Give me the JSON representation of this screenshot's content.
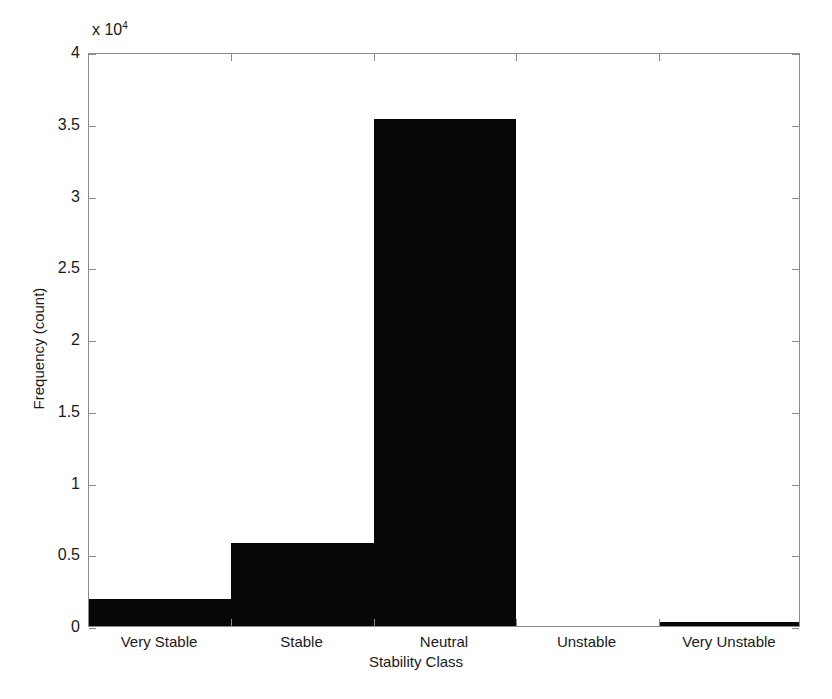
{
  "chart_data": {
    "type": "bar",
    "title": "",
    "subtitle": "",
    "xlabel": "Stability Class",
    "ylabel": "Frequency (count)",
    "categories": [
      "Very Stable",
      "Stable",
      "Neutral",
      "Unstable",
      "Very Unstable"
    ],
    "values": [
      1900,
      5800,
      35300,
      0,
      300
    ],
    "values_scaled": [
      0.19,
      0.58,
      3.53,
      0.0,
      0.03
    ],
    "y_multiplier_text": "x 10",
    "y_multiplier_exponent": "4",
    "y_multiplier_value": 10000,
    "ylim": [
      0,
      40000
    ],
    "ylim_scaled": [
      0,
      4
    ],
    "ytick_labels": [
      "0",
      "0.5",
      "1",
      "1.5",
      "2",
      "2.5",
      "3",
      "3.5",
      "4"
    ],
    "ytick_values": [
      0,
      0.5,
      1,
      1.5,
      2,
      2.5,
      3,
      3.5,
      4
    ],
    "bar_color": "#070707",
    "axis_color": "#8c8c8c",
    "background_color": "#ffffff",
    "grid": false,
    "legend": false,
    "legend_position": "none",
    "bar_style": "contiguous-histogram"
  }
}
